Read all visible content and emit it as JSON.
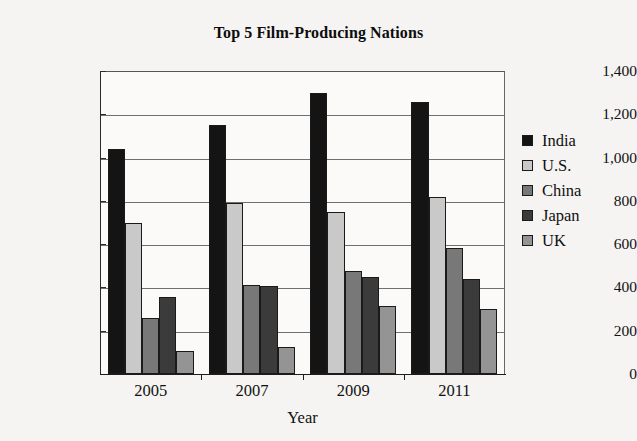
{
  "chart_data": {
    "type": "bar",
    "title": "Top 5 Film-Producing Nations",
    "xlabel": "Year",
    "ylabel": "Number of Films Produced",
    "categories": [
      "2005",
      "2007",
      "2009",
      "2011"
    ],
    "ylim": [
      0,
      1400
    ],
    "yticks": [
      0,
      200,
      400,
      600,
      800,
      1000,
      1200,
      1400
    ],
    "ytick_labels": [
      "0",
      "200",
      "400",
      "600",
      "800",
      "1,000",
      "1,200",
      "1,400"
    ],
    "grid": true,
    "legend_position": "right",
    "series": [
      {
        "name": "India",
        "color": "#141414",
        "values": [
          1040,
          1150,
          1300,
          1255
        ]
      },
      {
        "name": "U.S.",
        "color": "#c9c9c9",
        "values": [
          700,
          790,
          750,
          820
        ]
      },
      {
        "name": "China",
        "color": "#787878",
        "values": [
          260,
          410,
          475,
          580
        ]
      },
      {
        "name": "Japan",
        "color": "#3b3b3b",
        "values": [
          355,
          405,
          450,
          440
        ]
      },
      {
        "name": "UK",
        "color": "#949494",
        "values": [
          105,
          125,
          315,
          300
        ]
      }
    ]
  }
}
